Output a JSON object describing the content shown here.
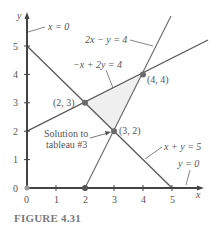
{
  "figure": {
    "caption": "FIGURE 4.31",
    "axes": {
      "x_label": "x",
      "y_label": "y",
      "x_ticks": [
        "0",
        "1",
        "2",
        "3",
        "4",
        "5"
      ],
      "y_ticks": [
        "0",
        "1",
        "2",
        "3",
        "4",
        "5"
      ]
    },
    "lines": [
      {
        "id": "x0",
        "label": "x = 0"
      },
      {
        "id": "y0",
        "label": "y = 0"
      },
      {
        "id": "l1",
        "label": "2x − y = 4"
      },
      {
        "id": "l2",
        "label": "−x + 2y = 4"
      },
      {
        "id": "l3",
        "label": "x + y = 5"
      }
    ],
    "points": [
      {
        "label": "(2, 3)",
        "x": 2,
        "y": 3
      },
      {
        "label": "(4, 4)",
        "x": 4,
        "y": 4
      },
      {
        "label": "(3, 2)",
        "x": 3,
        "y": 2
      }
    ],
    "annotation": {
      "line1": "Solution to",
      "line2": "tableau #3"
    },
    "colors": {
      "axis": "#444444",
      "line": "#5a5a5a",
      "text": "#555555",
      "region": "#efefef",
      "point": "#6a6a6a"
    }
  }
}
